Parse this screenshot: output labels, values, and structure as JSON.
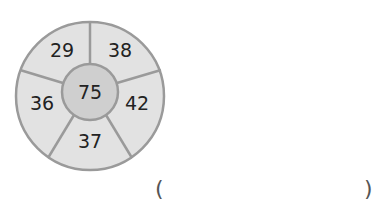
{
  "puzzle": {
    "center": "75",
    "segments": [
      "29",
      "38",
      "42",
      "37",
      "36"
    ],
    "answer_blank": {
      "open": "(",
      "close": ")"
    }
  },
  "colors": {
    "outer_fill": "#e2e2e2",
    "inner_fill": "#cfcfcf",
    "stroke": "#9a9a9a",
    "text": "#222222"
  }
}
